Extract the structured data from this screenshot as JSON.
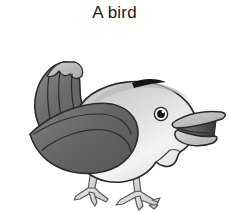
{
  "page": {
    "background_color": "#ffffff",
    "width": 229,
    "height": 212
  },
  "caption": {
    "text": "A bird",
    "color": "#1a1a1a"
  },
  "illustration": {
    "subject": "bird",
    "style": "greyscale clip art line drawing",
    "facing": "right",
    "alt_text": "A grey bird with an upturned tail and open beak, standing on two legs",
    "outline_color": "#2b2b2b",
    "parts": [
      {
        "name": "tail",
        "label": "tail",
        "fill": "#6e6e6e"
      },
      {
        "name": "tail-tip",
        "label": "tail tip feathers",
        "fill": "#b4b4b4"
      },
      {
        "name": "back",
        "label": "back",
        "fill": "#bdbdbd"
      },
      {
        "name": "belly",
        "label": "belly",
        "fill": "#f2f2f2"
      },
      {
        "name": "breast",
        "label": "breast",
        "fill": "#e8e8e8"
      },
      {
        "name": "wing",
        "label": "wing",
        "fill": "#6a6a6a"
      },
      {
        "name": "crown-patch",
        "label": "dark crown patch",
        "fill": "#151515"
      },
      {
        "name": "beak-upper",
        "label": "upper beak",
        "fill": "#bcbcbc"
      },
      {
        "name": "beak-lower",
        "label": "lower beak",
        "fill": "#cccccc"
      },
      {
        "name": "mouth",
        "label": "open mouth interior",
        "fill": "#4a4a4a"
      },
      {
        "name": "eye",
        "label": "eye",
        "fill": "#ffffff"
      },
      {
        "name": "pupil",
        "label": "pupil",
        "fill": "#141414"
      },
      {
        "name": "eye-highlight",
        "label": "eye highlight",
        "fill": "#ffffff"
      },
      {
        "name": "legs",
        "label": "legs and feet",
        "fill": "#dcdcdc"
      }
    ],
    "colors": {
      "tail_dark": "#6e6e6e",
      "tail_light": "#b4b4b4",
      "back_grey": "#bdbdbd",
      "belly_light": "#f2f2f2",
      "wing_grey": "#6a6a6a",
      "crown_black": "#151515",
      "beak_grey": "#bcbcbc",
      "mouth_dark": "#4a4a4a",
      "leg_grey": "#dcdcdc",
      "outline": "#2b2b2b"
    }
  }
}
